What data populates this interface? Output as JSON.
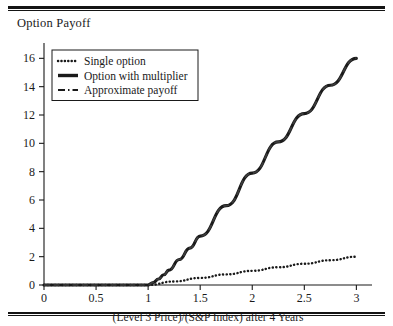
{
  "figure": {
    "y_axis_title": "Option Payoff",
    "x_axis_title": "(Level 3 Price)/(S&P Index) after 4 Years",
    "rule_color": "#141414"
  },
  "legend": {
    "entries": [
      {
        "label": "Single option",
        "style": "dotted",
        "color": "#1a1a1a"
      },
      {
        "label": "Option with multiplier",
        "style": "solid-bold",
        "color": "#1a1a1a"
      },
      {
        "label": "Approximate payoff",
        "style": "dashed",
        "color": "#1a1a1a"
      }
    ]
  },
  "axes": {
    "x_ticks": [
      "0",
      "0.5",
      "1",
      "1.5",
      "2",
      "2.5",
      "3"
    ],
    "y_ticks": [
      "0",
      "2",
      "4",
      "6",
      "8",
      "10",
      "12",
      "14",
      "16"
    ]
  },
  "chart_data": {
    "type": "line",
    "title": "",
    "xlabel": "(Level 3 Price)/(S&P Index) after 4 Years",
    "ylabel": "Option Payoff",
    "xlim": [
      0,
      3.15
    ],
    "ylim": [
      0,
      16.8
    ],
    "xticks": [
      0,
      0.5,
      1,
      1.5,
      2,
      2.5,
      3
    ],
    "yticks": [
      0,
      2,
      4,
      6,
      8,
      10,
      12,
      14,
      16
    ],
    "grid": false,
    "legend_position": "upper-left",
    "series": [
      {
        "name": "Single option",
        "style": "dotted",
        "x": [
          0,
          0.5,
          1,
          1.25,
          1.5,
          1.75,
          2,
          2.25,
          2.5,
          2.75,
          3
        ],
        "y": [
          0,
          0,
          0,
          0.25,
          0.5,
          0.75,
          1.0,
          1.25,
          1.5,
          1.75,
          2.0
        ]
      },
      {
        "name": "Option with multiplier",
        "style": "solid-bold",
        "x": [
          0,
          0.5,
          1.0,
          1.05,
          1.1,
          1.15,
          1.2,
          1.3,
          1.4,
          1.5,
          1.75,
          2,
          2.25,
          2.5,
          2.75,
          3
        ],
        "y": [
          0,
          0,
          0,
          0.18,
          0.42,
          0.72,
          1.05,
          1.8,
          2.6,
          3.45,
          5.6,
          7.9,
          10.1,
          12.1,
          14.1,
          16.0
        ]
      },
      {
        "name": "Approximate payoff",
        "style": "dashed",
        "x": [
          0,
          0.5,
          1.0,
          1.05,
          1.1,
          1.15,
          1.2,
          1.3,
          1.4,
          1.5,
          1.75,
          2,
          2.25,
          2.5,
          2.75,
          3
        ],
        "y": [
          0,
          0,
          0,
          0.18,
          0.42,
          0.72,
          1.05,
          1.8,
          2.6,
          3.45,
          5.6,
          7.9,
          10.1,
          12.1,
          14.1,
          16.0
        ]
      }
    ]
  }
}
